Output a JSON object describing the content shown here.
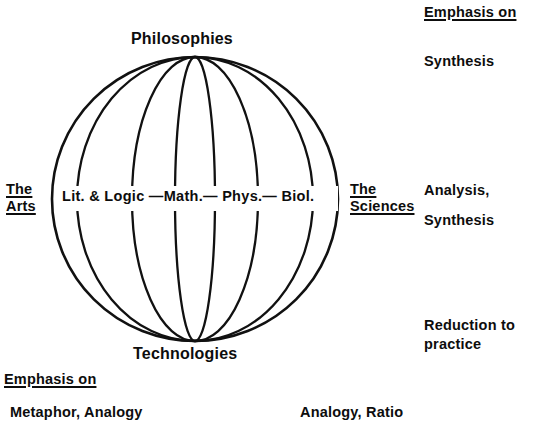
{
  "figure": {
    "type": "sphere-diagram",
    "title_top": "Philosophies",
    "title_bottom": "Technologies",
    "equator_axis": "Lit. & Logic —Math.— Phys.— Biol.",
    "equator_nodes": [
      "Lit. & Logic",
      "Math.",
      "Phys.",
      "Biol."
    ],
    "left_pole": {
      "line1": "The",
      "line2": "Arts"
    },
    "right_pole": {
      "line1": "The",
      "line2": "Sciences"
    }
  },
  "annotations": {
    "right_column": {
      "heading": "Emphasis on",
      "item_top": "Synthesis",
      "item_middle_1": "Analysis,",
      "item_middle_2": "Synthesis",
      "item_bottom": "Reduction to practice"
    },
    "bottom_left": {
      "heading": "Emphasis on",
      "item": "Metaphor, Analogy"
    },
    "bottom_center": {
      "item": "Analogy, Ratio"
    }
  },
  "geometry": {
    "center_x": 195,
    "center_y": 199,
    "radius_x": 143,
    "radius_y": 142,
    "meridian_count": 4
  },
  "colors": {
    "ink": "#111111",
    "background": "#ffffff"
  }
}
